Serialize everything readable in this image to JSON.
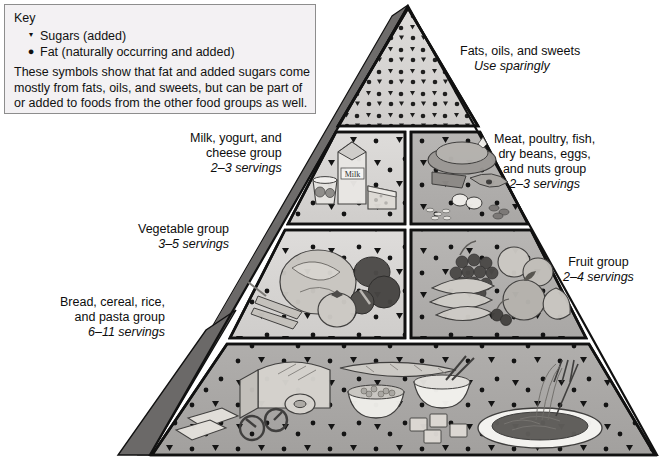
{
  "diagram": {
    "type": "food-guide-pyramid"
  },
  "key": {
    "heading": "Key",
    "symbols": [
      {
        "glyph": "▾",
        "name": "sugars-symbol",
        "label": "Sugars (added)"
      },
      {
        "glyph": "●",
        "name": "fat-symbol",
        "label": "Fat (naturally occurring and added)"
      }
    ],
    "note_lines": [
      "These symbols show that fat and added sugars come",
      "mostly from fats, oils, and sweets, but can be part of",
      "or added to foods from the other food groups as well."
    ]
  },
  "tiers": [
    {
      "id": "fats-oils-sweets",
      "label_lines": [
        "Fats, oils, and sweets"
      ],
      "servings": "Use sparingly",
      "servings_italic": true,
      "side": "right",
      "level": 1
    },
    {
      "id": "milk-yogurt-cheese",
      "label_lines": [
        "Milk, yogurt, and",
        "cheese group"
      ],
      "servings": "2–3 servings",
      "servings_italic": true,
      "side": "left",
      "level": 2,
      "art_caption": "Milk"
    },
    {
      "id": "meat-poultry-fish",
      "label_lines": [
        "Meat, poultry, fish,",
        "dry beans, eggs,",
        "and nuts group"
      ],
      "servings": "2–3 servings",
      "servings_italic": true,
      "side": "right",
      "level": 2
    },
    {
      "id": "vegetable",
      "label_lines": [
        "Vegetable group"
      ],
      "servings": "3–5 servings",
      "servings_italic": true,
      "side": "left",
      "level": 3
    },
    {
      "id": "fruit",
      "label_lines": [
        "Fruit group"
      ],
      "servings": "2–4 servings",
      "servings_italic": true,
      "side": "right",
      "level": 3
    },
    {
      "id": "bread-cereal-rice-pasta",
      "label_lines": [
        "Bread, cereal, rice,",
        "and pasta group"
      ],
      "servings": "6–11 servings",
      "servings_italic": true,
      "side": "left",
      "level": 4
    }
  ],
  "colors": {
    "key_bg": "#f3f1f3",
    "key_border": "#8d8d8d",
    "pyramid_face_light": "#d8d6d4",
    "pyramid_face_mid": "#b3b1af",
    "pyramid_side_dark": "#6e6c6b",
    "pyramid_outline": "#111111",
    "text": "#0d0d0d"
  }
}
